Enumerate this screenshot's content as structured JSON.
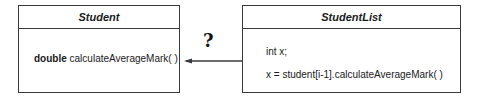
{
  "diagram": {
    "classes": [
      {
        "name": "Student",
        "members": [
          {
            "type": "double",
            "signature": "calculateAverageMark( )"
          }
        ]
      },
      {
        "name": "StudentList",
        "members": [
          {
            "text": "int x;"
          },
          {
            "text": "x = student[i-1].calculateAverageMark( )"
          }
        ]
      }
    ],
    "relationship": {
      "from": "StudentList",
      "to": "Student",
      "label": "?",
      "arrow": "left-pointing open arrowhead"
    },
    "colors": {
      "line": "#3a3a3a",
      "text": "#1a1a1a",
      "background": "#ffffff"
    }
  }
}
